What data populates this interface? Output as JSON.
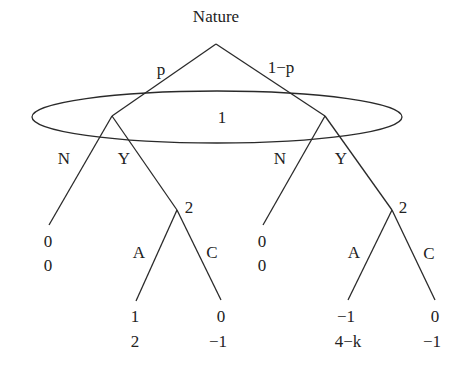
{
  "title": "Nature",
  "nature_moves": {
    "left": "p",
    "right": "1−p"
  },
  "information_set": {
    "player": "1"
  },
  "player1_moves": {
    "no": "N",
    "yes": "Y"
  },
  "player2": {
    "left_node_label": "2",
    "right_node_label": "2",
    "moves": {
      "a": "A",
      "c": "C"
    }
  },
  "payoffs": {
    "left_N": {
      "p1": "0",
      "p2": "0"
    },
    "left_A": {
      "p1": "1",
      "p2": "2"
    },
    "left_C": {
      "p1": "0",
      "p2": "−1"
    },
    "right_N": {
      "p1": "0",
      "p2": "0"
    },
    "right_A": {
      "p1": "−1",
      "p2": "4−k"
    },
    "right_C": {
      "p1": "0",
      "p2": "−1"
    }
  }
}
